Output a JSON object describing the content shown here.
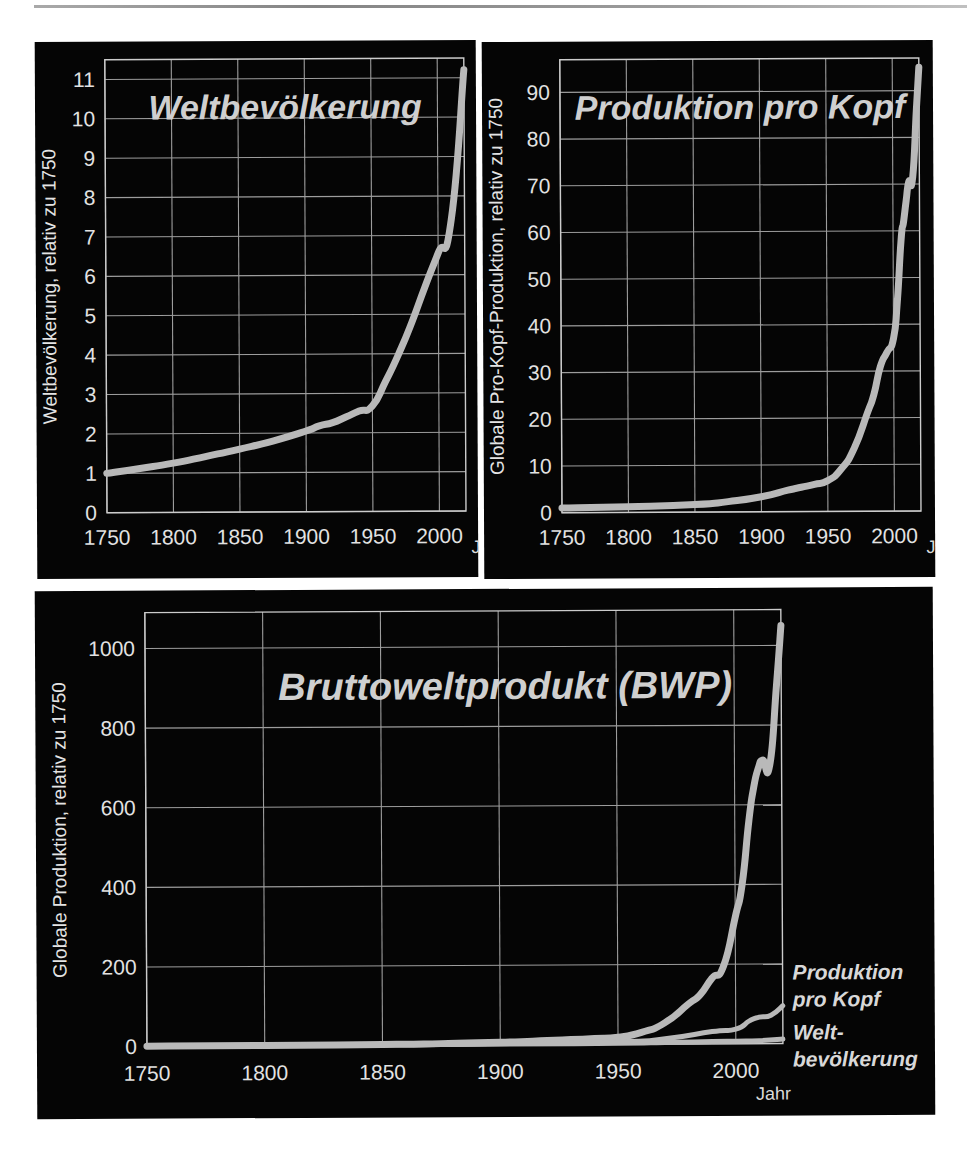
{
  "page": {
    "background": "#ffffff",
    "panel_background": "#050505",
    "curve_color": "#b9b9b9",
    "grid_color": "#9d9d9d",
    "text_color": "#e2e2e2"
  },
  "shared": {
    "x_axis_label": "Jahr",
    "x_ticks": [
      1750,
      1800,
      1850,
      1900,
      1950,
      2000
    ],
    "x_min": 1750,
    "x_max": 2020
  },
  "chart_data": [
    {
      "id": "weltbevoelkerung",
      "type": "line",
      "title": "Weltbevölkerung",
      "xlabel": "Jahr",
      "ylabel": "Weltbevölkerung, relativ zu 1750",
      "xlim": [
        1750,
        2020
      ],
      "ylim": [
        0,
        11.5
      ],
      "x_ticks": [
        1750,
        1800,
        1850,
        1900,
        1950,
        2000
      ],
      "y_ticks": [
        0,
        1,
        2,
        3,
        4,
        5,
        6,
        7,
        8,
        9,
        10,
        11
      ],
      "grid": true,
      "legend": "none",
      "series": [
        {
          "name": "Weltbevölkerung",
          "x": [
            1750,
            1775,
            1800,
            1825,
            1850,
            1875,
            1900,
            1910,
            1920,
            1930,
            1940,
            1950,
            1960,
            1970,
            1980,
            1990,
            2000,
            2010,
            2020
          ],
          "values": [
            1.0,
            1.12,
            1.25,
            1.42,
            1.6,
            1.8,
            2.05,
            2.18,
            2.26,
            2.4,
            2.55,
            2.68,
            3.3,
            4.0,
            4.8,
            5.7,
            6.55,
            7.4,
            11.2
          ]
        }
      ]
    },
    {
      "id": "produktion-pro-kopf",
      "type": "line",
      "title": "Produktion pro Kopf",
      "xlabel": "Jahr",
      "ylabel": "Globale Pro-Kopf-Produktion, relativ zu 1750",
      "xlim": [
        1750,
        2020
      ],
      "ylim": [
        0,
        97
      ],
      "x_ticks": [
        1750,
        1800,
        1850,
        1900,
        1950,
        2000
      ],
      "y_ticks": [
        0,
        10,
        20,
        30,
        40,
        50,
        60,
        70,
        80,
        90
      ],
      "grid": true,
      "legend": "none",
      "series": [
        {
          "name": "Produktion pro Kopf",
          "x": [
            1750,
            1800,
            1850,
            1875,
            1900,
            1920,
            1930,
            1940,
            1950,
            1960,
            1970,
            1980,
            1985,
            1990,
            1995,
            2000,
            2003,
            2006,
            2008,
            2010,
            2012,
            2015,
            2018,
            2020
          ],
          "values": [
            1.0,
            1.2,
            1.6,
            2.2,
            3.2,
            4.6,
            5.2,
            5.8,
            6.6,
            9.0,
            13.5,
            21.0,
            25.0,
            31.0,
            34.0,
            37.0,
            45.0,
            58.0,
            62.0,
            66.5,
            70.5,
            71.5,
            86.0,
            95.0
          ]
        }
      ]
    },
    {
      "id": "bruttoweltprodukt",
      "type": "line",
      "title": "Bruttoweltprodukt (BWP)",
      "xlabel": "Jahr",
      "ylabel": "Globale Produktion, relativ zu 1750",
      "xlim": [
        1750,
        2020
      ],
      "ylim": [
        0,
        1090
      ],
      "x_ticks": [
        1750,
        1800,
        1850,
        1900,
        1950,
        2000
      ],
      "y_ticks": [
        0,
        200,
        400,
        600,
        800,
        1000
      ],
      "grid": true,
      "legend": "inline-right",
      "annotations": [
        {
          "id": "note-pro-kopf",
          "lines": [
            "Produktion",
            "pro Kopf"
          ]
        },
        {
          "id": "note-weltbevoelkerung",
          "lines": [
            "Welt-",
            "bevölkerung"
          ]
        }
      ],
      "series": [
        {
          "name": "Bruttoweltprodukt (BWP)",
          "x": [
            1750,
            1800,
            1850,
            1875,
            1900,
            1920,
            1930,
            1940,
            1950,
            1960,
            1970,
            1980,
            1985,
            1990,
            1995,
            2000,
            2003,
            2006,
            2008,
            2010,
            2012,
            2015,
            2018,
            2020
          ],
          "values": [
            1,
            1.5,
            2.6,
            4.0,
            6.6,
            10.4,
            12.5,
            14.8,
            17.7,
            29.7,
            54.0,
            100.8,
            124.0,
            165.0,
            196.0,
            318.0,
            400.0,
            560.0,
            640.0,
            690.0,
            712.0,
            700.0,
            900.0,
            1050.0
          ]
        },
        {
          "name": "Produktion pro Kopf",
          "x": [
            1750,
            1800,
            1850,
            1900,
            1950,
            1970,
            1990,
            2000,
            2006,
            2010,
            2015,
            2020
          ],
          "values": [
            1.0,
            1.2,
            1.6,
            3.2,
            6.6,
            13.5,
            31.0,
            37.0,
            58.0,
            66.5,
            71.5,
            95.0
          ]
        },
        {
          "name": "Weltbevölkerung",
          "x": [
            1750,
            1800,
            1850,
            1900,
            1950,
            1970,
            1990,
            2000,
            2010,
            2020
          ],
          "values": [
            1.0,
            1.25,
            1.6,
            2.05,
            2.68,
            4.0,
            5.7,
            6.55,
            7.4,
            11.2
          ]
        }
      ]
    }
  ]
}
